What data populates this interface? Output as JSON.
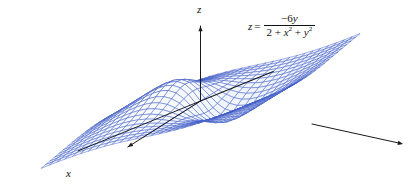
{
  "figure": {
    "title": "",
    "equation": {
      "lhs": "z",
      "relation": "=",
      "numerator_sign": "−",
      "numerator": "6y",
      "numerator_full": "−6y",
      "denominator_full": "2 + x² + y²",
      "denominator_terms": [
        "2",
        "+",
        "x",
        "2",
        "+",
        "y",
        "2"
      ],
      "plain": "z = -6y / (2 + x^2 + y^2)"
    },
    "axes": {
      "x_label": "x",
      "y_label": "",
      "z_label": "z"
    },
    "colors": {
      "mesh_line": "#3a56c4",
      "mesh_line_light": "#7f92dd",
      "surface_fill": "#eef2fc",
      "axis": "#1a1a1a",
      "background": "#ffffff",
      "text": "#111111"
    }
  },
  "chart_data": {
    "type": "surface",
    "title": "",
    "xlabel": "x",
    "ylabel": "y",
    "zlabel": "z",
    "function": "z = -6y / (2 + x^2 + y^2)",
    "xlim": [
      -4,
      4
    ],
    "ylim": [
      -4,
      4
    ],
    "zlim": [
      -2.2,
      2.2
    ],
    "grid_n": 26,
    "features": [
      {
        "name": "peak",
        "location": [
          0,
          -1.414
        ],
        "value": 2.12
      },
      {
        "name": "valley",
        "location": [
          0,
          1.414
        ],
        "value": -2.12
      },
      {
        "name": "saddle-plane",
        "location": [
          0,
          0
        ],
        "value": 0
      }
    ],
    "legend": "none",
    "grid": true
  }
}
